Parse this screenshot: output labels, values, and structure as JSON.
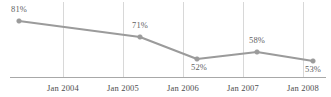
{
  "chart_data": {
    "type": "line",
    "title": "",
    "subtitle": "",
    "xlabel": "",
    "ylabel": "",
    "grid": "vertical-only",
    "legend": "none",
    "axis_color": "#a8a8a8",
    "gridline_color": "#d8d8d8",
    "series_color": "#9b9b9b",
    "label_color": "#5f5f5f",
    "categories": [
      "Jan 2004",
      "Jan 2005",
      "Jan 2006",
      "Jan 2007",
      "Jan 2008"
    ],
    "series": [
      {
        "name": "",
        "values": [
          81,
          71,
          52,
          58,
          53
        ],
        "point_labels": [
          "81%",
          "71%",
          "52%",
          "58%",
          "53%"
        ]
      }
    ],
    "ylim": [
      0,
      100
    ],
    "points": [
      {
        "label": "81%",
        "value": 81,
        "x": 19,
        "y": 21,
        "label_x": 19,
        "label_y": 12,
        "label_anchor": "middle"
      },
      {
        "label": "71%",
        "value": 71,
        "x": 140,
        "y": 37,
        "label_x": 140,
        "label_y": 28,
        "label_anchor": "middle"
      },
      {
        "label": "52%",
        "value": 52,
        "x": 197,
        "y": 59,
        "label_x": 199,
        "label_y": 70,
        "label_anchor": "middle"
      },
      {
        "label": "58%",
        "value": 58,
        "x": 257,
        "y": 52,
        "label_x": 257,
        "label_y": 43,
        "label_anchor": "middle"
      },
      {
        "label": "53%",
        "value": 53,
        "x": 313,
        "y": 61,
        "label_x": 313,
        "label_y": 72,
        "label_anchor": "middle"
      }
    ],
    "gridlines_x": [
      63,
      123,
      183,
      243,
      303
    ],
    "axis_y": 77,
    "axis_x_start": 10,
    "axis_x_end": 326,
    "tick_labels": [
      {
        "text": "Jan 2004",
        "x": 63,
        "y": 91
      },
      {
        "text": "Jan 2005",
        "x": 123,
        "y": 91
      },
      {
        "text": "Jan 2006",
        "x": 183,
        "y": 91
      },
      {
        "text": "Jan 2007",
        "x": 243,
        "y": 91
      },
      {
        "text": "Jan 2008",
        "x": 303,
        "y": 91
      }
    ]
  }
}
